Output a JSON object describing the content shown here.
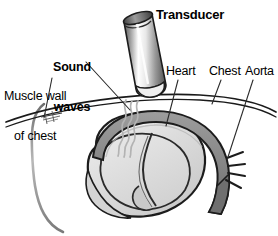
{
  "figure": {
    "background_color": "#ffffff",
    "width": 278,
    "height": 236
  },
  "labels": {
    "transducer": "Transducer",
    "sound_waves_line1": "Sound",
    "sound_waves_line2": "waves",
    "muscle_wall_line1": "Muscle wall",
    "muscle_wall_line2": "of chest",
    "heart": "Heart",
    "chest": "Chest",
    "aorta": "Aorta"
  },
  "colors": {
    "outline": "#1a1a1a",
    "text": "#000000",
    "leader_line": "#2b2b2b",
    "heart_fill": "#d8d8d8",
    "heart_fill_light": "#e4e4e4",
    "aorta_fill": "#8c8c8c",
    "aorta_fill_dark": "#6f6f6f",
    "sound_wave": "#b0b0b0",
    "body_outline": "#8f8f8f",
    "probe_dark": "#4a4a4a",
    "probe_light": "#f2f2f2",
    "probe_cap": "#5a5a5a"
  },
  "parts": {
    "transducer": "ultrasound probe cylinder tilted, resting on chest wall",
    "sound_waves": "three wavy gray lines from probe tip into chest",
    "chest_wall": "double arc line across image",
    "muscle_wall": "short hatched marker on chest wall at left",
    "body_outline": "curved gray line descending at left edge",
    "heart": "rounded heart mass with internal chambers",
    "aorta": "dark gray arch over heart descending right with branch vessels"
  }
}
